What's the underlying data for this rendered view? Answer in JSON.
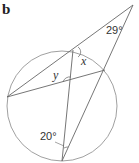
{
  "part_label": "b",
  "angles": {
    "apex": "29°",
    "bottom": "20°",
    "x": "x",
    "y": "y"
  },
  "colors": {
    "line": "#666666",
    "circle": "#888888"
  }
}
